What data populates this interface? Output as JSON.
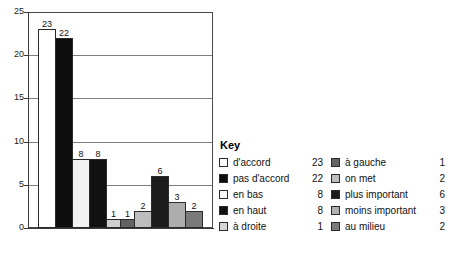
{
  "chart_data": {
    "type": "bar",
    "title": "",
    "xlabel": "",
    "ylabel": "",
    "ylim": [
      0,
      25
    ],
    "yticks": [
      0,
      5,
      10,
      15,
      20,
      25
    ],
    "grid": true,
    "legend_position": "right",
    "categories": [
      "d'accord",
      "pas d'accord",
      "en bas",
      "en haut",
      "à droite",
      "à gauche",
      "on met",
      "plus important",
      "moins important",
      "au milieu"
    ],
    "values": [
      23,
      22,
      8,
      8,
      1,
      1,
      2,
      6,
      3,
      2
    ],
    "value_labels": [
      "23",
      "22",
      "8",
      "8",
      "1",
      "1",
      "2",
      "6",
      "3",
      "2"
    ],
    "colors": [
      "#ffffff",
      "#0d0d0d",
      "#f2f2f2",
      "#111111",
      "#cfcfcf",
      "#636363",
      "#bdbdbd",
      "#1c1c1c",
      "#adadad",
      "#7a7a7a"
    ]
  },
  "axis": {
    "y_tick_labels": [
      "25",
      "20",
      "15",
      "10",
      "5",
      "0"
    ]
  },
  "legend": {
    "title": "Key",
    "column_a": [
      {
        "label": "d'accord",
        "count": "23",
        "color": "#ffffff"
      },
      {
        "label": "pas d'accord",
        "count": "22",
        "color": "#0d0d0d"
      },
      {
        "label": "en bas",
        "count": "8",
        "color": "#fbfbfb"
      },
      {
        "label": "en haut",
        "count": "8",
        "color": "#111111"
      },
      {
        "label": "à droite",
        "count": "1",
        "color": "#d6d6d6"
      }
    ],
    "column_b": [
      {
        "label": "à gauche",
        "count": "1",
        "color": "#636363"
      },
      {
        "label": "on met",
        "count": "2",
        "color": "#bdbdbd"
      },
      {
        "label": "plus important",
        "count": "6",
        "color": "#1c1c1c"
      },
      {
        "label": "moins important",
        "count": "3",
        "color": "#b0b0b0"
      },
      {
        "label": "au milieu",
        "count": "2",
        "color": "#7a7a7a"
      }
    ]
  }
}
